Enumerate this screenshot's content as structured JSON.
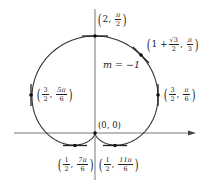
{
  "diagram": {
    "type": "polar-curve",
    "curve": "r = 1 + sin θ",
    "scale_px_per_unit": 48.5,
    "origin_px": [
      95,
      133
    ],
    "colors": {
      "curve": "#333333",
      "axes": "#555555",
      "text": "#222222",
      "points": "#111111"
    },
    "slope_label": "m = −1",
    "points": [
      {
        "id": "top",
        "r": "2",
        "theta_num": "π",
        "theta_den": "2",
        "tangent": "horizontal"
      },
      {
        "id": "tangent-slope",
        "r_prefix": "1 + ",
        "r_num": "√3",
        "r_den": "2",
        "theta_num": "π",
        "theta_den": "3",
        "tangent": "slope -1"
      },
      {
        "id": "left-vertical",
        "r_num": "3",
        "r_den": "2",
        "theta_num": "5π",
        "theta_den": "6",
        "tangent": "vertical"
      },
      {
        "id": "right-vertical",
        "r_num": "3",
        "r_den": "2",
        "theta_num": "π",
        "theta_den": "6",
        "tangent": "vertical"
      },
      {
        "id": "origin",
        "label": "(0, 0)",
        "tangent": "vertical"
      },
      {
        "id": "bottom-left",
        "r_num": "1",
        "r_den": "2",
        "theta_num": "7π",
        "theta_den": "6",
        "tangent": "horizontal"
      },
      {
        "id": "bottom-right",
        "r_num": "1",
        "r_den": "2",
        "theta_num": "11π",
        "theta_den": "6",
        "tangent": "horizontal"
      }
    ]
  }
}
